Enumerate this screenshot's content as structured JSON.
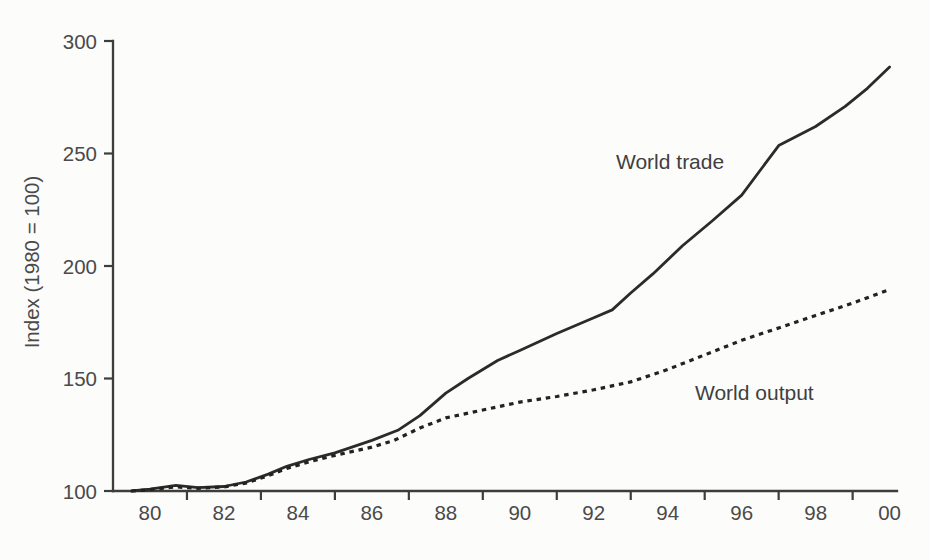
{
  "figure": {
    "background": "#fcfcfb",
    "text_color": "#4a4a4a",
    "line_color": "#2b2b2b",
    "axis_color": "#3d3d3d"
  },
  "chart_data": {
    "type": "line",
    "title": "",
    "xlabel": "",
    "ylabel": "Index (1980 = 100)",
    "grid": false,
    "legend": "inline-labels",
    "xlim": [
      1979,
      2000.2
    ],
    "ylim": [
      100,
      300
    ],
    "y_ticks": [
      100,
      150,
      200,
      250,
      300
    ],
    "y_tick_labels": [
      "100",
      "150",
      "200",
      "250",
      "300"
    ],
    "x_label_years": [
      1980,
      1982,
      1984,
      1986,
      1988,
      1990,
      1992,
      1994,
      1996,
      1998,
      2000
    ],
    "x_tick_labels": [
      "80",
      "82",
      "84",
      "86",
      "88",
      "90",
      "92",
      "94",
      "96",
      "98",
      "00"
    ],
    "x_minor_tick_years": [
      1981,
      1983,
      1985,
      1987,
      1989,
      1991,
      1993,
      1995,
      1997,
      1999
    ],
    "series": [
      {
        "name": "World trade",
        "line_style": "solid",
        "points": [
          [
            1979.5,
            100
          ],
          [
            1980,
            100.8
          ],
          [
            1980.7,
            102.5
          ],
          [
            1981.3,
            101.5
          ],
          [
            1982,
            102
          ],
          [
            1982.6,
            104
          ],
          [
            1983.2,
            107.5
          ],
          [
            1983.7,
            111
          ],
          [
            1984.3,
            114
          ],
          [
            1985,
            117
          ],
          [
            1986,
            122.5
          ],
          [
            1986.7,
            127
          ],
          [
            1987.3,
            133.5
          ],
          [
            1988,
            143.5
          ],
          [
            1988.6,
            150
          ],
          [
            1989.4,
            158
          ],
          [
            1990,
            162.5
          ],
          [
            1991,
            170
          ],
          [
            1992,
            177
          ],
          [
            1992.5,
            180.5
          ],
          [
            1993,
            188
          ],
          [
            1993.6,
            196.5
          ],
          [
            1994.4,
            209
          ],
          [
            1995.2,
            220
          ],
          [
            1996,
            231.5
          ],
          [
            1997,
            253.5
          ],
          [
            1998,
            262
          ],
          [
            1998.8,
            271
          ],
          [
            1999.4,
            279
          ],
          [
            2000,
            288.5
          ]
        ]
      },
      {
        "name": "World output",
        "line_style": "dotted",
        "points": [
          [
            1979.5,
            100
          ],
          [
            1980,
            100.6
          ],
          [
            1980.7,
            101.8
          ],
          [
            1981.3,
            101.2
          ],
          [
            1982,
            101.8
          ],
          [
            1982.6,
            103.5
          ],
          [
            1983.2,
            106.8
          ],
          [
            1983.7,
            110
          ],
          [
            1984.3,
            113
          ],
          [
            1985,
            115.8
          ],
          [
            1986,
            119.5
          ],
          [
            1986.6,
            122.5
          ],
          [
            1987.3,
            128
          ],
          [
            1988,
            132.5
          ],
          [
            1989,
            136
          ],
          [
            1990,
            139.5
          ],
          [
            1991,
            142
          ],
          [
            1992,
            145
          ],
          [
            1993,
            148.5
          ],
          [
            1994,
            154
          ],
          [
            1995,
            160.5
          ],
          [
            1996,
            167
          ],
          [
            1997,
            172.5
          ],
          [
            1998,
            178
          ],
          [
            1999,
            183.5
          ],
          [
            2000,
            189.5
          ]
        ]
      }
    ]
  }
}
